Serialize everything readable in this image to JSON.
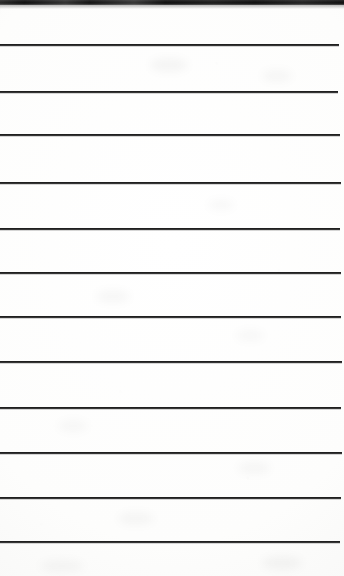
{
  "scan": {
    "kind": "lined-notepad-page",
    "description": "Scanned blank ruled notepad sheet with dark binding strip along the top edge",
    "width_px": 344,
    "height_px": 576,
    "background_color": "#fdfdfc",
    "rule_color": "#1f1f1f",
    "binding_color": "#141414"
  },
  "binding": {
    "label": "top-binding-strip",
    "top_px": 0,
    "height_px": 5,
    "left_px": 0,
    "width_px": 344
  },
  "rules": [
    {
      "index": 1,
      "y_px": 44,
      "left_px": 0,
      "width_px": 339,
      "thickness_px": 2
    },
    {
      "index": 2,
      "y_px": 91,
      "left_px": 0,
      "width_px": 338,
      "thickness_px": 2
    },
    {
      "index": 3,
      "y_px": 134,
      "left_px": 0,
      "width_px": 340,
      "thickness_px": 2
    },
    {
      "index": 4,
      "y_px": 182,
      "left_px": 0,
      "width_px": 341,
      "thickness_px": 2
    },
    {
      "index": 5,
      "y_px": 228,
      "left_px": 0,
      "width_px": 340,
      "thickness_px": 2
    },
    {
      "index": 6,
      "y_px": 272,
      "left_px": 0,
      "width_px": 341,
      "thickness_px": 2
    },
    {
      "index": 7,
      "y_px": 316,
      "left_px": 0,
      "width_px": 341,
      "thickness_px": 2
    },
    {
      "index": 8,
      "y_px": 361,
      "left_px": 0,
      "width_px": 342,
      "thickness_px": 2
    },
    {
      "index": 9,
      "y_px": 407,
      "left_px": 0,
      "width_px": 341,
      "thickness_px": 2
    },
    {
      "index": 10,
      "y_px": 452,
      "left_px": 0,
      "width_px": 342,
      "thickness_px": 2
    },
    {
      "index": 11,
      "y_px": 497,
      "left_px": 0,
      "width_px": 341,
      "thickness_px": 2
    },
    {
      "index": 12,
      "y_px": 541,
      "left_px": 0,
      "width_px": 340,
      "thickness_px": 2
    }
  ],
  "smudges": [
    {
      "x_px": 150,
      "y_px": 58,
      "w_px": 38,
      "h_px": 14,
      "opacity": 0.035
    },
    {
      "x_px": 262,
      "y_px": 70,
      "w_px": 30,
      "h_px": 12,
      "opacity": 0.03
    },
    {
      "x_px": 208,
      "y_px": 200,
      "w_px": 26,
      "h_px": 10,
      "opacity": 0.028
    },
    {
      "x_px": 96,
      "y_px": 290,
      "w_px": 34,
      "h_px": 13,
      "opacity": 0.03
    },
    {
      "x_px": 236,
      "y_px": 330,
      "w_px": 28,
      "h_px": 11,
      "opacity": 0.026
    },
    {
      "x_px": 58,
      "y_px": 420,
      "w_px": 30,
      "h_px": 12,
      "opacity": 0.028
    },
    {
      "x_px": 238,
      "y_px": 462,
      "w_px": 32,
      "h_px": 12,
      "opacity": 0.032
    },
    {
      "x_px": 118,
      "y_px": 512,
      "w_px": 36,
      "h_px": 13,
      "opacity": 0.03
    },
    {
      "x_px": 262,
      "y_px": 556,
      "w_px": 40,
      "h_px": 14,
      "opacity": 0.034
    },
    {
      "x_px": 40,
      "y_px": 560,
      "w_px": 44,
      "h_px": 12,
      "opacity": 0.03
    }
  ]
}
